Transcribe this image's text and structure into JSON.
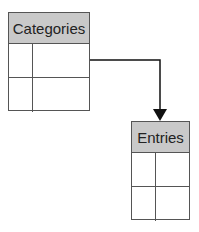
{
  "tables": [
    {
      "name": "Categories",
      "rows": 2,
      "cols": 2
    },
    {
      "name": "Entries",
      "rows": 2,
      "cols": 2
    }
  ],
  "connector": {
    "from": "Categories",
    "to": "Entries",
    "color": "#111111"
  },
  "colors": {
    "header_bg": "#c9c9c9",
    "border": "#555555"
  }
}
